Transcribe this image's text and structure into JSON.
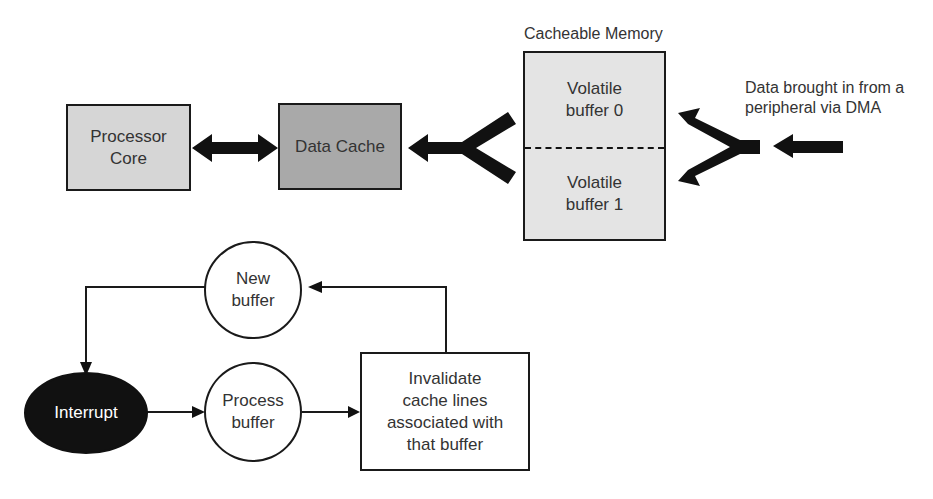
{
  "diagram": {
    "top": {
      "processor_core": "Processor\nCore",
      "data_cache": "Data Cache",
      "cacheable_memory_title": "Cacheable Memory",
      "buffer0": "Volatile\nbuffer 0",
      "buffer1": "Volatile\nbuffer 1",
      "dma_label": "Data brought in from a\nperipheral via DMA"
    },
    "bottom": {
      "new_buffer": "New\nbuffer",
      "interrupt": "Interrupt",
      "process_buffer": "Process\nbuffer",
      "invalidate": "Invalidate\ncache lines\nassociated with\nthat buffer"
    },
    "colors": {
      "processor_fill": "#d6d6d6",
      "cache_fill": "#a9a9a9",
      "memory_fill": "#e4e4e4",
      "interrupt_fill": "#111111",
      "stroke": "#1a1a1a"
    }
  }
}
